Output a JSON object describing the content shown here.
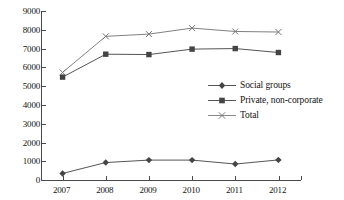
{
  "chart_data": {
    "type": "line",
    "title": "",
    "xlabel": "",
    "ylabel": "",
    "categories": [
      "2007",
      "2008",
      "2009",
      "2010",
      "2011",
      "2012"
    ],
    "ylim": [
      0,
      9000
    ],
    "ytick_values": [
      0,
      1000,
      2000,
      3000,
      4000,
      5000,
      6000,
      7000,
      8000,
      9000
    ],
    "ytick_labels": [
      "0",
      "1000",
      "2000",
      "3000",
      "4000",
      "5000",
      "6000",
      "7000",
      "8000",
      "9000"
    ],
    "grid": false,
    "legend_position": "center-right",
    "series": [
      {
        "name": "Social groups",
        "marker": "diamond",
        "color": "#555555",
        "values": [
          350,
          930,
          1060,
          1060,
          850,
          1070
        ]
      },
      {
        "name": "Private, non-corporate",
        "marker": "square",
        "color": "#555555",
        "values": [
          5480,
          6700,
          6680,
          6970,
          7000,
          6790
        ]
      },
      {
        "name": "Total",
        "marker": "cross",
        "color": "#808080",
        "values": [
          5730,
          7650,
          7770,
          8090,
          7910,
          7880
        ]
      }
    ]
  },
  "legend": {
    "items": [
      {
        "label": "Social groups"
      },
      {
        "label": "Private, non-corporate"
      },
      {
        "label": "Total"
      }
    ]
  },
  "colors": {
    "axis": "#4a4a4a",
    "text": "#141414",
    "series_dark": "#555555",
    "series_light": "#808080",
    "background": "#ffffff"
  }
}
